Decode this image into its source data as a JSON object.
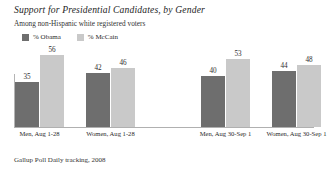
{
  "chart_data": {
    "type": "bar",
    "title": "Support for Presidential Candidates, by Gender",
    "subtitle": "Among non-Hispanic white registered voters",
    "source": "Gallup Poll Daily tracking, 2008",
    "xlabel": "",
    "ylabel": "",
    "ylim": [
      0,
      60
    ],
    "grid": false,
    "legend_position": "top-left",
    "categories": [
      "Men, Aug 1-28",
      "Women, Aug 1-28",
      "Men, Aug 30-Sep 1",
      "Women, Aug 30-Sep 1"
    ],
    "series": [
      {
        "name": "% Obama",
        "color": "#6e6e6e",
        "values": [
          35,
          42,
          40,
          44
        ]
      },
      {
        "name": "% McCain",
        "color": "#c9c9c9",
        "values": [
          56,
          46,
          53,
          48
        ]
      }
    ],
    "group_gap_after_index": 1
  },
  "colors": {
    "obama": "#6e6e6e",
    "mccain": "#c9c9c9",
    "axis": "#b0b0b0",
    "text": "#2b2b2b",
    "background": "#ffffff"
  }
}
